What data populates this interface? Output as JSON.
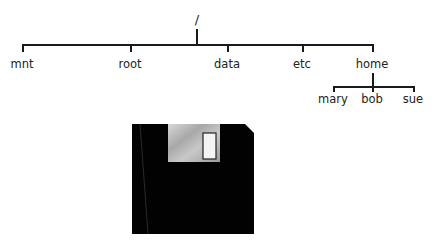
{
  "tree": {
    "root": "/",
    "children": [
      "mnt",
      "root",
      "data",
      "etc",
      "home"
    ],
    "home_children": [
      "mary",
      "bob",
      "sue"
    ]
  },
  "floppy": {
    "icon": "floppy-disk-icon",
    "colors": {
      "body": "#000000",
      "label": "#b8b8b8",
      "window": "#f4f4f4"
    }
  }
}
